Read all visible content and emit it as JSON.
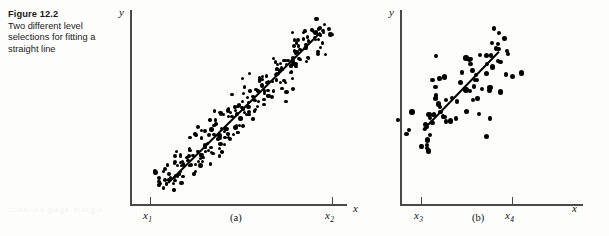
{
  "figure": {
    "number_label": "Figure 12.2",
    "caption": "Two different level selections for fitting a straight line"
  },
  "ghost_artifact": "scanned page margin",
  "chart_data": [
    {
      "id": "a",
      "type": "scatter",
      "subcaption": "(a)",
      "title": "",
      "xlabel": "x",
      "ylabel": "y",
      "xticks": [
        "x₁",
        "x₂"
      ],
      "xtick_labels": [
        "x1",
        "x2"
      ],
      "xtick_values": [
        1,
        2
      ],
      "grid": false,
      "legend": "none",
      "n_points": 250,
      "x_range_of_data": [
        1,
        2
      ],
      "fit_line": {
        "label": "least squares straight line",
        "slope_sign": "positive"
      },
      "note": "wide level selection: x1 to x2 far apart, dense tight band",
      "points": [
        [
          0.05,
          0.1
        ],
        [
          0.07,
          0.04
        ],
        [
          0.02,
          0.07
        ],
        [
          0.1,
          0.14
        ],
        [
          0.12,
          0.06
        ],
        [
          0.09,
          0.18
        ],
        [
          0.14,
          0.11
        ],
        [
          0.16,
          0.2
        ],
        [
          0.04,
          0.16
        ],
        [
          0.18,
          0.08
        ],
        [
          0.2,
          0.22
        ],
        [
          0.13,
          0.25
        ],
        [
          0.22,
          0.15
        ],
        [
          0.24,
          0.27
        ],
        [
          0.17,
          0.3
        ],
        [
          0.26,
          0.19
        ],
        [
          0.28,
          0.32
        ],
        [
          0.21,
          0.24
        ],
        [
          0.3,
          0.26
        ],
        [
          0.32,
          0.35
        ],
        [
          0.25,
          0.38
        ],
        [
          0.34,
          0.29
        ],
        [
          0.36,
          0.4
        ],
        [
          0.29,
          0.33
        ],
        [
          0.38,
          0.31
        ],
        [
          0.4,
          0.44
        ],
        [
          0.33,
          0.47
        ],
        [
          0.42,
          0.37
        ],
        [
          0.44,
          0.49
        ],
        [
          0.37,
          0.42
        ],
        [
          0.46,
          0.39
        ],
        [
          0.48,
          0.52
        ],
        [
          0.41,
          0.55
        ],
        [
          0.5,
          0.45
        ],
        [
          0.52,
          0.57
        ],
        [
          0.45,
          0.5
        ],
        [
          0.54,
          0.47
        ],
        [
          0.56,
          0.6
        ],
        [
          0.49,
          0.63
        ],
        [
          0.58,
          0.53
        ],
        [
          0.6,
          0.65
        ],
        [
          0.53,
          0.58
        ],
        [
          0.62,
          0.55
        ],
        [
          0.64,
          0.68
        ],
        [
          0.57,
          0.71
        ],
        [
          0.66,
          0.61
        ],
        [
          0.68,
          0.73
        ],
        [
          0.61,
          0.66
        ],
        [
          0.7,
          0.63
        ],
        [
          0.72,
          0.76
        ],
        [
          0.65,
          0.79
        ],
        [
          0.74,
          0.69
        ],
        [
          0.76,
          0.81
        ],
        [
          0.69,
          0.74
        ],
        [
          0.78,
          0.71
        ],
        [
          0.8,
          0.84
        ],
        [
          0.73,
          0.87
        ],
        [
          0.82,
          0.77
        ],
        [
          0.84,
          0.89
        ],
        [
          0.77,
          0.82
        ],
        [
          0.86,
          0.79
        ],
        [
          0.88,
          0.92
        ],
        [
          0.81,
          0.95
        ],
        [
          0.9,
          0.85
        ],
        [
          0.92,
          0.97
        ],
        [
          0.85,
          0.9
        ],
        [
          0.94,
          0.87
        ],
        [
          0.96,
          1.0
        ],
        [
          0.89,
          0.93
        ],
        [
          0.98,
          0.91
        ]
      ]
    },
    {
      "id": "b",
      "type": "scatter",
      "subcaption": "(b)",
      "title": "",
      "xlabel": "x",
      "ylabel": "y",
      "xticks": [
        "x₃",
        "x₄"
      ],
      "xtick_labels": [
        "x3",
        "x4"
      ],
      "xtick_values": [
        3,
        4
      ],
      "grid": false,
      "legend": "none",
      "n_points": 78,
      "x_range_of_data": [
        3,
        4
      ],
      "fit_line": {
        "label": "least squares straight line",
        "slope_sign": "positive"
      },
      "note": "narrow level selection: x3 to x4 close together, scatter relatively wider"
    }
  ]
}
